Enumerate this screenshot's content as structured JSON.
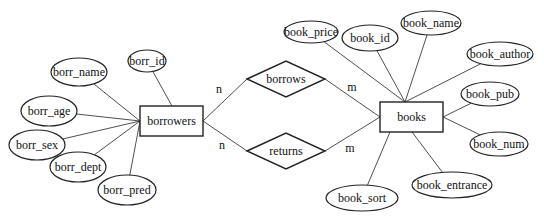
{
  "diagram": {
    "type": "ER diagram",
    "entities": [
      {
        "id": "borrowers",
        "label": "borrowers",
        "x": 140,
        "y": 106,
        "w": 63,
        "h": 30
      },
      {
        "id": "books",
        "label": "books",
        "x": 380,
        "y": 102,
        "w": 63,
        "h": 30
      }
    ],
    "relationships": [
      {
        "id": "borrows",
        "label": "borrows",
        "cx": 286,
        "cy": 79,
        "hw": 39,
        "hh": 18
      },
      {
        "id": "returns",
        "label": "returns",
        "cx": 286,
        "cy": 151,
        "hw": 39,
        "hh": 18
      }
    ],
    "attributes": [
      {
        "label": "borr_id",
        "entity": "borrowers",
        "cx": 147,
        "cy": 61,
        "rx": 19,
        "ry": 11,
        "to": [
          172,
          106
        ]
      },
      {
        "label": "borr_name",
        "entity": "borrowers",
        "cx": 79,
        "cy": 72,
        "rx": 28,
        "ry": 14,
        "to": [
          140,
          121
        ]
      },
      {
        "label": "borr_age",
        "entity": "borrowers",
        "cx": 49,
        "cy": 111,
        "rx": 28,
        "ry": 15,
        "to": [
          140,
          121
        ]
      },
      {
        "label": "borr_sex",
        "entity": "borrowers",
        "cx": 37,
        "cy": 145,
        "rx": 28,
        "ry": 15,
        "to": [
          140,
          121
        ]
      },
      {
        "label": "borr_dept",
        "entity": "borrowers",
        "cx": 78,
        "cy": 167,
        "rx": 28,
        "ry": 15,
        "to": [
          140,
          121
        ]
      },
      {
        "label": "borr_pred",
        "entity": "borrowers",
        "cx": 127,
        "cy": 190,
        "rx": 29,
        "ry": 15,
        "to": [
          140,
          121
        ]
      },
      {
        "label": "book_price",
        "entity": "books",
        "cx": 311,
        "cy": 32,
        "rx": 27,
        "ry": 11,
        "to": [
          405,
          102
        ]
      },
      {
        "label": "book_id",
        "entity": "books",
        "cx": 370,
        "cy": 38,
        "rx": 28,
        "ry": 13,
        "to": [
          405,
          102
        ]
      },
      {
        "label": "book_name",
        "entity": "books",
        "cx": 431,
        "cy": 23,
        "rx": 30,
        "ry": 12,
        "to": [
          405,
          102
        ]
      },
      {
        "label": "book_author",
        "entity": "books",
        "cx": 500,
        "cy": 54,
        "rx": 33,
        "ry": 12,
        "to": [
          405,
          102
        ]
      },
      {
        "label": "book_pub",
        "entity": "books",
        "cx": 490,
        "cy": 94,
        "rx": 29,
        "ry": 12,
        "to": [
          443,
          117
        ]
      },
      {
        "label": "book_num",
        "entity": "books",
        "cx": 499,
        "cy": 144,
        "rx": 29,
        "ry": 12,
        "to": [
          443,
          117
        ]
      },
      {
        "label": "book_entrance",
        "entity": "books",
        "cx": 452,
        "cy": 185,
        "rx": 40,
        "ry": 13,
        "to": [
          412,
          132
        ]
      },
      {
        "label": "book_sort",
        "entity": "books",
        "cx": 362,
        "cy": 198,
        "rx": 36,
        "ry": 13,
        "to": [
          390,
          132
        ]
      }
    ],
    "connections": [
      {
        "from": [
          203,
          121
        ],
        "to": [
          247,
          79
        ]
      },
      {
        "from": [
          325,
          79
        ],
        "to": [
          380,
          117
        ]
      },
      {
        "from": [
          203,
          121
        ],
        "to": [
          247,
          151
        ]
      },
      {
        "from": [
          325,
          151
        ],
        "to": [
          380,
          117
        ]
      }
    ],
    "cardinalities": [
      {
        "label": "n",
        "x": 219,
        "y": 89
      },
      {
        "label": "m",
        "x": 352,
        "y": 87
      },
      {
        "label": "n",
        "x": 222,
        "y": 145
      },
      {
        "label": "m",
        "x": 350,
        "y": 148
      }
    ],
    "colors": {
      "stroke": "#222222",
      "text": "#111111",
      "background": "#ffffff"
    }
  }
}
